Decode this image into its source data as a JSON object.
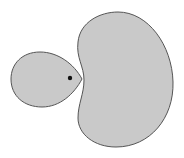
{
  "diagram": {
    "colors": {
      "background": "#ffffff",
      "fill": "#c9c9c9",
      "stroke": "#555555",
      "dot": "#111111"
    },
    "shapes": [
      {
        "id": "teardrop",
        "type": "teardrop",
        "bbox": [
          11,
          52,
          82,
          107
        ],
        "tip": [
          82,
          79
        ]
      },
      {
        "id": "kidney",
        "type": "kidney",
        "bbox": [
          75,
          12,
          173,
          147
        ]
      },
      {
        "id": "dot",
        "type": "point",
        "center": [
          70,
          78
        ],
        "radius": 2.2
      }
    ]
  }
}
